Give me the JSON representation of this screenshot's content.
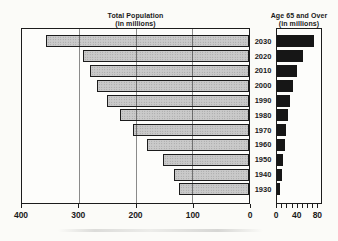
{
  "figure": {
    "left_chart": {
      "title_line1": "Total Population",
      "title_line2": "(in millions)"
    },
    "right_chart": {
      "title_line1": "Age 65 and Over",
      "title_line2": "(in millions)"
    }
  },
  "colors": {
    "left_bar_fill": "#cacaca",
    "left_bar_pattern_dot": "#989898",
    "left_bar_border": "#1c1c1c",
    "right_bar_fill": "#161616",
    "plot_border": "#1c1c1c",
    "text": "#1a1a1a"
  },
  "chart_data": [
    {
      "type": "bar",
      "orientation": "horizontal",
      "title": "Total Population (in millions)",
      "categories": [
        "2030",
        "2020",
        "2010",
        "2000",
        "1990",
        "1980",
        "1970",
        "1960",
        "1950",
        "1940",
        "1930"
      ],
      "values": [
        358,
        292,
        280,
        267,
        250,
        228,
        205,
        179,
        151,
        133,
        123
      ],
      "axis": {
        "position": "bottom",
        "range": [
          400,
          0
        ],
        "reversed": true,
        "tick_labels": [
          "400",
          "300",
          "200",
          "100",
          "0"
        ],
        "tick_values": [
          400,
          300,
          200,
          100,
          0
        ],
        "gridlines": [
          300,
          200,
          100
        ]
      },
      "legend": "none",
      "bar_anchor": "right"
    },
    {
      "type": "bar",
      "orientation": "horizontal",
      "title": "Age 65 and Over (in millions)",
      "categories": [
        "2030",
        "2020",
        "2010",
        "2000",
        "1990",
        "1980",
        "1970",
        "1960",
        "1950",
        "1940",
        "1930"
      ],
      "values": [
        74,
        52,
        40,
        31,
        26,
        22,
        18,
        16,
        11,
        9,
        6
      ],
      "axis": {
        "position": "bottom",
        "range": [
          0,
          87
        ],
        "reversed": false,
        "tick_labels": [
          "0",
          "40",
          "80"
        ],
        "tick_values": [
          0,
          40,
          80
        ],
        "minor_tick_step": 10,
        "minor_tick_max": 80
      },
      "legend": "none",
      "bar_anchor": "left"
    }
  ]
}
